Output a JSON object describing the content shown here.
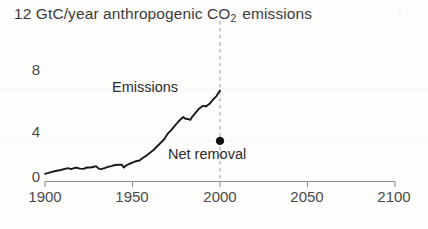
{
  "chart_data": {
    "type": "line",
    "title": "12 GtC/year anthropogenic CO2 emissions",
    "title_prefix": "12 GtC/year anthropogenic CO",
    "title_sub": "2",
    "title_suffix": " emissions",
    "xlabel": "",
    "ylabel": "GtC/year",
    "xlim": [
      1900,
      2100
    ],
    "ylim": [
      0,
      12
    ],
    "xticks": [
      1900,
      1950,
      2000,
      2050,
      2100
    ],
    "xticklabels": [
      "1900",
      "1950",
      "2000",
      "2050",
      "2100"
    ],
    "yticks": [
      0,
      4,
      8,
      12
    ],
    "yticklabels": [
      "0",
      "4",
      "8",
      "12"
    ],
    "grid": false,
    "legend": "none",
    "line_color": "#1a1a1a",
    "axis_color": "#8a8a8a",
    "series": [
      {
        "name": "Emissions",
        "x": [
          1900,
          1903,
          1906,
          1909,
          1912,
          1913,
          1915,
          1917,
          1918,
          1920,
          1922,
          1924,
          1926,
          1928,
          1929,
          1931,
          1932,
          1934,
          1936,
          1938,
          1940,
          1942,
          1944,
          1945,
          1946,
          1948,
          1950,
          1952,
          1954,
          1956,
          1958,
          1960,
          1962,
          1964,
          1966,
          1968,
          1970,
          1972,
          1974,
          1976,
          1978,
          1979,
          1980,
          1982,
          1983,
          1984,
          1986,
          1988,
          1990,
          1991,
          1992,
          1994,
          1996,
          1998,
          2000
        ],
        "values": [
          0.55,
          0.65,
          0.75,
          0.82,
          0.92,
          0.95,
          0.88,
          0.97,
          0.98,
          0.92,
          0.9,
          1.0,
          1.0,
          1.05,
          1.1,
          0.9,
          0.88,
          0.95,
          1.05,
          1.1,
          1.18,
          1.2,
          1.2,
          1.0,
          1.12,
          1.25,
          1.35,
          1.45,
          1.5,
          1.7,
          1.85,
          2.05,
          2.25,
          2.5,
          2.75,
          3.0,
          3.4,
          3.65,
          3.95,
          4.25,
          4.5,
          4.6,
          4.5,
          4.45,
          4.4,
          4.6,
          4.9,
          5.2,
          5.4,
          5.4,
          5.35,
          5.55,
          5.85,
          6.1,
          6.5
        ]
      }
    ],
    "annotations": [
      {
        "name": "emissions-label",
        "text": "Emissions",
        "x_px": 112,
        "y_px": 86
      },
      {
        "name": "net-removal-label",
        "text": "Net removal",
        "x_px": 168,
        "y_px": 148
      }
    ],
    "markers": [
      {
        "name": "net-removal-point",
        "label": "Net removal",
        "x": 2000,
        "y": 2.9,
        "color": "#111111",
        "radius_px": 4.2
      }
    ],
    "reference_lines": [
      {
        "name": "present-day-line",
        "orientation": "vertical",
        "x": 2000,
        "style": "dashed",
        "color": "#9a9a9a"
      }
    ]
  }
}
